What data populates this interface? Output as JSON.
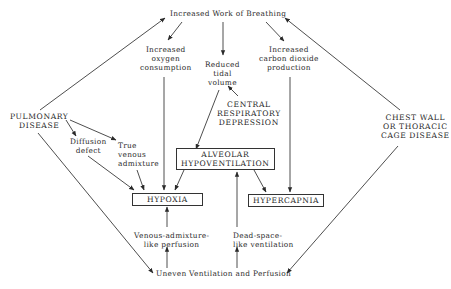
{
  "diagram": {
    "nodes": {
      "work": {
        "lines": [
          "Increased Work of Breathing"
        ]
      },
      "oxygen": {
        "lines": [
          "Increased",
          "oxygen",
          "consumption"
        ]
      },
      "tidal": {
        "lines": [
          "Reduced",
          "tidal",
          "volume"
        ]
      },
      "co2": {
        "lines": [
          "Increased",
          "carbon dioxide",
          "production"
        ]
      },
      "central": {
        "lines": [
          "CENTRAL",
          "RESPIRATORY",
          "DEPRESSION"
        ]
      },
      "pulmonary": {
        "lines": [
          "PULMONARY",
          "DISEASE"
        ]
      },
      "chest": {
        "lines": [
          "CHEST WALL",
          "OR THORACIC",
          "CAGE DISEASE"
        ]
      },
      "diffusion": {
        "lines": [
          "Diffusion",
          "defect"
        ]
      },
      "venous": {
        "lines": [
          "True",
          "venous",
          "admixture"
        ]
      },
      "alveolar": {
        "lines": [
          "ALVEOLAR",
          "HYPOVENTILATION"
        ]
      },
      "hypoxia": {
        "lines": [
          "HYPOXIA"
        ]
      },
      "hypercapnia": {
        "lines": [
          "HYPERCAPNIA"
        ]
      },
      "venous_perf": {
        "lines": [
          "Venous-admixture-",
          "like perfusion"
        ]
      },
      "dead_space": {
        "lines": [
          "Dead-space-",
          "like ventilation"
        ]
      },
      "uneven": {
        "lines": [
          "Uneven Ventilation and Perfusion"
        ]
      }
    },
    "edges": [
      {
        "from": "pulmonary",
        "to": "work"
      },
      {
        "from": "chest",
        "to": "work"
      },
      {
        "from": "work",
        "to": "oxygen"
      },
      {
        "from": "work",
        "to": "tidal"
      },
      {
        "from": "work",
        "to": "co2"
      },
      {
        "from": "central",
        "to": "tidal"
      },
      {
        "from": "tidal",
        "to": "alveolar"
      },
      {
        "from": "oxygen",
        "to": "hypoxia"
      },
      {
        "from": "co2",
        "to": "hypercapnia"
      },
      {
        "from": "pulmonary",
        "to": "diffusion"
      },
      {
        "from": "pulmonary",
        "to": "venous"
      },
      {
        "from": "diffusion",
        "to": "hypoxia"
      },
      {
        "from": "venous",
        "to": "hypoxia"
      },
      {
        "from": "alveolar",
        "to": "hypoxia"
      },
      {
        "from": "alveolar",
        "to": "hypercapnia"
      },
      {
        "from": "pulmonary",
        "to": "uneven"
      },
      {
        "from": "chest",
        "to": "uneven"
      },
      {
        "from": "uneven",
        "to": "venous_perf"
      },
      {
        "from": "uneven",
        "to": "dead_space"
      },
      {
        "from": "venous_perf",
        "to": "hypoxia"
      },
      {
        "from": "dead_space",
        "to": "alveolar"
      }
    ],
    "colors": {
      "line": "#3a3a3a",
      "text": "#2a2a2a",
      "background": "#ffffff"
    }
  }
}
